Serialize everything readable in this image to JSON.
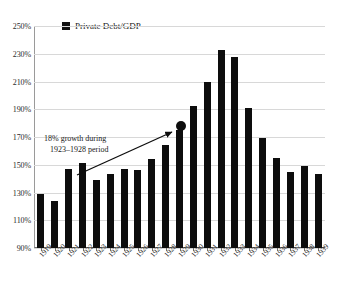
{
  "legend": {
    "marker": "black-square-marker",
    "label": "Private Debt/GDP"
  },
  "annotation": {
    "line1": "18% growth during",
    "line2": "1923–1928 period",
    "arrow": "arrow-up-right",
    "highlight_marker": "emphasis-dot"
  },
  "axis": {
    "y_ticks": [
      "250%",
      "230%",
      "210%",
      "190%",
      "170%",
      "150%",
      "130%",
      "110%",
      "90%"
    ]
  },
  "colors": {
    "bar": "#0d0d0d",
    "grid": "#d8d8d8",
    "axis": "#6f6f6f",
    "text": "#1a1a1a",
    "background": "#ffffff"
  },
  "chart_data": {
    "type": "bar",
    "title": "",
    "subtitle": "",
    "xlabel": "",
    "ylabel": "",
    "ylim": [
      90,
      250
    ],
    "ytick_step": 20,
    "grid": true,
    "legend_position": "top-left-inside",
    "series_name": "Private Debt/GDP",
    "unit": "percent of GDP",
    "categories": [
      "1919",
      "1920",
      "1921",
      "1922",
      "1923",
      "1924",
      "1925",
      "1926",
      "1927",
      "1928",
      "1929",
      "1930",
      "1931",
      "1932",
      "1933",
      "1934",
      "1935",
      "1936",
      "1937",
      "1938",
      "1939"
    ],
    "values": [
      129,
      124,
      147,
      151,
      139,
      143,
      147,
      146,
      154,
      164,
      175,
      192,
      210,
      233,
      228,
      191,
      169,
      155,
      145,
      149,
      143
    ],
    "annotations": [
      {
        "text": "18% growth during 1923–1928 period",
        "points_to": "1929",
        "type": "arrow-with-label"
      }
    ]
  }
}
